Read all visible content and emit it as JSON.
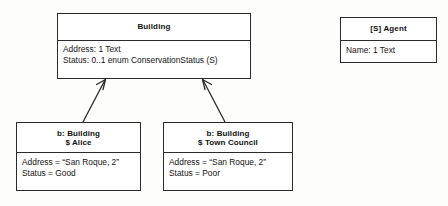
{
  "diagram": {
    "type": "uml-class-and-object-diagram",
    "background_color": "#ffffff",
    "line_color": "#2b2b2b",
    "text_color": "#111111"
  },
  "building_class": {
    "name": "Building",
    "attributes": [
      "Address: 1 Text",
      "Status: 0..1 enum ConservationStatus (S)"
    ]
  },
  "agent_class": {
    "name": "[S] Agent",
    "attributes": [
      "Name: 1 Text"
    ]
  },
  "instances": [
    {
      "id": "alice",
      "header_line_1": "b: Building",
      "header_line_2": "$ Alice",
      "attributes": [
        "Address = “San Roque, 2”",
        "Status = Good"
      ]
    },
    {
      "id": "town-council",
      "header_line_1": "b: Building",
      "header_line_2": "$ Town Council",
      "attributes": [
        "Address = “San Roque, 2”",
        "Status = Poor"
      ]
    }
  ],
  "connectors": [
    {
      "name": "alice-to-building",
      "from": "alice",
      "to": "building_class",
      "arrow_style": "open-arrowhead"
    },
    {
      "name": "town-council-to-building",
      "from": "town-council",
      "to": "building_class",
      "arrow_style": "open-arrowhead"
    }
  ]
}
